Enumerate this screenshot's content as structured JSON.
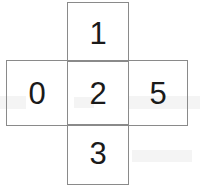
{
  "figure": {
    "type": "cube-net",
    "shape": "cross",
    "title": "",
    "background_color": "#ffffff",
    "line_color": "#8a8a8a",
    "digit_color": "#1a1a1a",
    "cells": [
      {
        "id": "top",
        "position": "top",
        "row": 1,
        "col": 2,
        "label": "1"
      },
      {
        "id": "left",
        "position": "left",
        "row": 2,
        "col": 1,
        "label": "0"
      },
      {
        "id": "center",
        "position": "center",
        "row": 2,
        "col": 2,
        "label": "2"
      },
      {
        "id": "right",
        "position": "right",
        "row": 2,
        "col": 3,
        "label": "5"
      },
      {
        "id": "bottom",
        "position": "bottom",
        "row": 3,
        "col": 2,
        "label": "3"
      }
    ]
  }
}
